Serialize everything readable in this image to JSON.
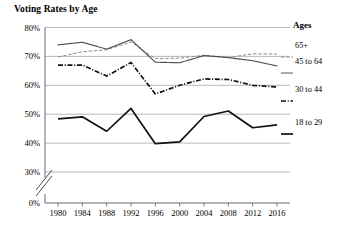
{
  "chart_data": {
    "type": "line",
    "title": "Voting Rates by Age",
    "xlabel": "",
    "ylabel": "",
    "categories": [
      "1980",
      "1984",
      "1988",
      "1992",
      "1996",
      "2000",
      "2004",
      "2008",
      "2012",
      "2016"
    ],
    "ylim": [
      0,
      80
    ],
    "yticks": [
      "0%",
      "30%",
      "40%",
      "50%",
      "60%",
      "70%",
      "80%"
    ],
    "ytick_values": [
      0,
      30,
      40,
      50,
      60,
      70,
      80
    ],
    "axis_break": true,
    "axis_break_between": [
      0,
      30
    ],
    "grid": true,
    "legend_position": "right",
    "legend_title": "Ages",
    "series": [
      {
        "name": "65+",
        "style": "dashed",
        "values": [
          69.8,
          71.6,
          72.3,
          75.0,
          69.2,
          69.4,
          70.4,
          69.6,
          70.9,
          70.8
        ]
      },
      {
        "name": "45 to 64",
        "style": "dotted",
        "values": [
          74.0,
          74.9,
          72.5,
          75.8,
          68.0,
          67.8,
          70.3,
          69.6,
          68.5,
          66.7
        ]
      },
      {
        "name": "30 to 44",
        "style": "dash-dot",
        "values": [
          67.0,
          67.0,
          63.2,
          67.9,
          57.0,
          60.0,
          62.2,
          62.0,
          60.0,
          59.4
        ]
      },
      {
        "name": "18 to 29",
        "style": "solid",
        "values": [
          48.4,
          49.1,
          44.1,
          52.0,
          39.8,
          40.4,
          49.2,
          51.1,
          45.3,
          46.3
        ]
      }
    ]
  },
  "legend": {
    "title": "Ages",
    "items": [
      {
        "label": "65+"
      },
      {
        "label": "45 to 64"
      },
      {
        "label": "30 to 44"
      },
      {
        "label": "18 to 29"
      }
    ]
  }
}
